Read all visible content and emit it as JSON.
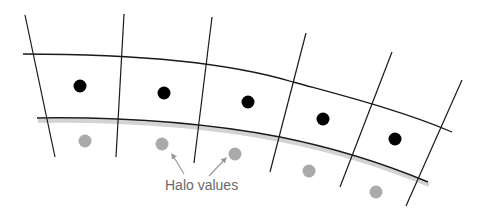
{
  "diagram": {
    "type": "curvilinear-grid-with-halo",
    "annotation_label": "Halo values",
    "colors": {
      "background": "#ffffff",
      "grid_lines": "#1a1a1a",
      "interior_points": "#000000",
      "halo_points": "#aaaaaa",
      "boundary_shadow": "#c8c8c8",
      "annotation_text": "#6a6a6a",
      "annotation_arrows": "#999999"
    },
    "radial_lines": [
      {
        "x1": 25,
        "y1": 15,
        "x2": 55,
        "y2": 157
      },
      {
        "x1": 124,
        "y1": 14,
        "x2": 116,
        "y2": 157
      },
      {
        "x1": 212,
        "y1": 17,
        "x2": 194,
        "y2": 163
      },
      {
        "x1": 306,
        "y1": 33,
        "x2": 270,
        "y2": 172
      },
      {
        "x1": 392,
        "y1": 52,
        "x2": 340,
        "y2": 187
      },
      {
        "x1": 462,
        "y1": 80,
        "x2": 406,
        "y2": 206
      }
    ],
    "outer_arc": "M23,54 C120,54 220,60 293,82 C340,95 400,110 452,132",
    "inner_boundary_arc": "M37,118 C110,117 190,120 280,137 C330,147 380,162 428,182",
    "interior_points": [
      {
        "cx": 80,
        "cy": 86
      },
      {
        "cx": 164,
        "cy": 93
      },
      {
        "cx": 248,
        "cy": 102
      },
      {
        "cx": 323,
        "cy": 119
      },
      {
        "cx": 395,
        "cy": 139
      }
    ],
    "halo_points": [
      {
        "cx": 85,
        "cy": 141
      },
      {
        "cx": 162,
        "cy": 144
      },
      {
        "cx": 235,
        "cy": 154
      },
      {
        "cx": 309,
        "cy": 171
      },
      {
        "cx": 376,
        "cy": 192
      }
    ],
    "arrows": [
      {
        "from": [
          184,
          174
        ],
        "to": [
          172,
          154
        ]
      },
      {
        "from": [
          209,
          176
        ],
        "to": [
          226,
          158
        ]
      }
    ],
    "label_position": {
      "left": 165,
      "top": 178
    }
  }
}
